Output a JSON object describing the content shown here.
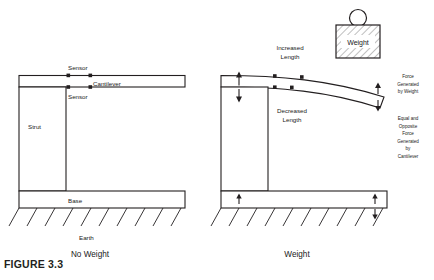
{
  "figure": {
    "caption_number": "FIGURE 3.3"
  },
  "colors": {
    "stroke": "#231f20",
    "text": "#1a1a1a",
    "hatch": "#6f6f6f",
    "background": "#ffffff"
  },
  "left_panel": {
    "caption": "No Weight",
    "labels": {
      "sensor_top": "Sensor",
      "cantilever": "Cantilever",
      "sensor_bottom": "Sensor",
      "strut": "Strut",
      "base": "Base",
      "earth": "Earth"
    }
  },
  "right_panel": {
    "caption": "Weight",
    "labels": {
      "weight_block": "Weight",
      "increased_length": "Increased\nLength",
      "increased_length_line1": "Increased",
      "increased_length_line2": "Length",
      "decreased_length_line1": "Decreased",
      "decreased_length_line2": "Length",
      "force_by_weight_line1": "Force",
      "force_by_weight_line2": "Generated",
      "force_by_weight_line3": "by Weight",
      "reaction_line1": "Equal and",
      "reaction_line2": "Opposite",
      "reaction_line3": "Force",
      "reaction_line4": "Generated",
      "reaction_line5": "by",
      "reaction_line6": "Cantilever"
    }
  }
}
